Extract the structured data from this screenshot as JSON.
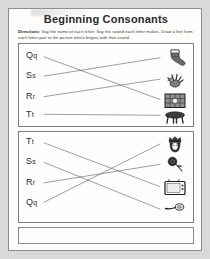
{
  "worksheet": {
    "title": "Beginning Consonants",
    "directions_label": "Directions:",
    "directions_text": "Say the name of each letter. Say the sound each letter makes. Draw a line from each letter pair to the picture which begins with that sound."
  },
  "exercises": [
    {
      "id": "box-1",
      "letters": [
        {
          "upper": "Q",
          "lower": "q"
        },
        {
          "upper": "S",
          "lower": "s"
        },
        {
          "upper": "R",
          "lower": "r"
        },
        {
          "upper": "T",
          "lower": "t"
        }
      ],
      "pictures": [
        {
          "name": "sock-picture",
          "label": "sock"
        },
        {
          "name": "rooster-picture",
          "label": "rooster"
        },
        {
          "name": "quilt-picture",
          "label": "quilt"
        },
        {
          "name": "table-picture",
          "label": "table"
        }
      ],
      "matches": [
        {
          "letter_index": 0,
          "picture_index": 2
        },
        {
          "letter_index": 1,
          "picture_index": 0
        },
        {
          "letter_index": 2,
          "picture_index": 1
        },
        {
          "letter_index": 3,
          "picture_index": 3
        }
      ]
    },
    {
      "id": "box-2",
      "letters": [
        {
          "upper": "T",
          "lower": "t"
        },
        {
          "upper": "S",
          "lower": "s"
        },
        {
          "upper": "R",
          "lower": "r"
        },
        {
          "upper": "Q",
          "lower": "q"
        }
      ],
      "pictures": [
        {
          "name": "queen-picture",
          "label": "queen"
        },
        {
          "name": "rose-picture",
          "label": "rose"
        },
        {
          "name": "television-picture",
          "label": "television"
        },
        {
          "name": "spoon-picture",
          "label": "spoon"
        }
      ],
      "matches": [
        {
          "letter_index": 0,
          "picture_index": 2
        },
        {
          "letter_index": 1,
          "picture_index": 3
        },
        {
          "letter_index": 2,
          "picture_index": 1
        },
        {
          "letter_index": 3,
          "picture_index": 0
        }
      ]
    }
  ],
  "colors": {
    "page": "#fdfdfc",
    "ink": "#2e2e2e",
    "line": "#4a4a4a",
    "border": "#7d7d7b",
    "backdrop": "#d9d9d7"
  }
}
